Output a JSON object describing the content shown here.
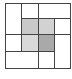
{
  "diagram": {
    "type": "grid-partition",
    "outer_box": {
      "x1": 5,
      "y1": 3,
      "x2": 70,
      "y2": 68
    },
    "line_color": "#444444",
    "lines": [
      {
        "orient": "v",
        "x": 21,
        "y1": 3,
        "y2": 51
      },
      {
        "orient": "v",
        "x": 38,
        "y1": 3,
        "y2": 68
      },
      {
        "orient": "v",
        "x": 54,
        "y1": 18,
        "y2": 68
      },
      {
        "orient": "h",
        "y": 18,
        "x1": 21,
        "x2": 70
      },
      {
        "orient": "h",
        "y": 34,
        "x1": 5,
        "x2": 70
      },
      {
        "orient": "h",
        "y": 51,
        "x1": 5,
        "x2": 54
      }
    ],
    "shaded_cells": [
      {
        "name": "shaded-cell-top-left",
        "x1": 21,
        "y1": 18,
        "x2": 38,
        "y2": 34,
        "color": "#c9c9c9"
      },
      {
        "name": "shaded-cell-top-right",
        "x1": 38,
        "y1": 18,
        "x2": 54,
        "y2": 34,
        "color": "#d2d2d2"
      },
      {
        "name": "shaded-cell-bottom-left",
        "x1": 21,
        "y1": 34,
        "x2": 38,
        "y2": 51,
        "color": "#d9d9d9"
      },
      {
        "name": "shaded-cell-bottom-right",
        "x1": 38,
        "y1": 34,
        "x2": 54,
        "y2": 51,
        "color": "#a9a9a9"
      }
    ]
  }
}
